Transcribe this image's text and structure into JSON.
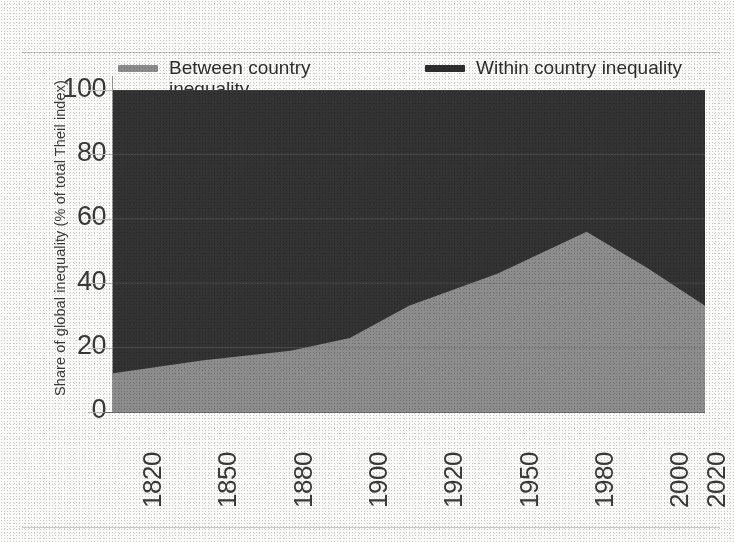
{
  "chart_data": {
    "type": "area",
    "title": "",
    "subtitle": "",
    "xlabel": "",
    "ylabel": "Share of global inequality (% of total Theil index)",
    "stacked": true,
    "grid": true,
    "legend_position": "top",
    "xlim": [
      1820,
      2020
    ],
    "ylim": [
      0,
      100
    ],
    "y_ticks": [
      0,
      20,
      40,
      60,
      80,
      100
    ],
    "x_ticks": [
      1820,
      1850,
      1880,
      1900,
      1920,
      1950,
      1980,
      2000,
      2020
    ],
    "x": [
      1820,
      1850,
      1880,
      1900,
      1920,
      1950,
      1980,
      2000,
      2020
    ],
    "series": [
      {
        "name": "Between country inequality",
        "color": "#8d8d8d",
        "values": [
          12,
          16,
          19,
          23,
          33,
          43,
          56,
          45,
          33
        ]
      },
      {
        "name": "Within country inequality",
        "color": "#333333",
        "values": [
          88,
          84,
          81,
          77,
          67,
          57,
          44,
          55,
          67
        ]
      }
    ]
  },
  "legend": {
    "items": [
      {
        "label": "Between country inequality",
        "color": "#8d8d8d",
        "swatch": "line-swatch"
      },
      {
        "label": "Within country inequality",
        "color": "#2e2e2e",
        "swatch": "line-swatch"
      }
    ]
  },
  "axes": {
    "y_title": "Share of global inequality (% of total Theil index)",
    "y_tick_labels": [
      "100",
      "80",
      "60",
      "40",
      "20",
      "0"
    ],
    "x_tick_labels": [
      "1820",
      "1850",
      "1880",
      "1900",
      "1920",
      "1950",
      "1980",
      "2000",
      "2020"
    ]
  },
  "colors": {
    "between": "#8d8d8d",
    "within": "#333333",
    "grid": "#6f6f6f",
    "text": "#3a3a3a",
    "page": "#fbfbf9"
  }
}
